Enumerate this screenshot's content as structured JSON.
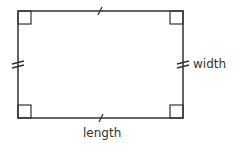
{
  "diagram": {
    "shape": "rectangle",
    "labels": {
      "width": "width",
      "length": "length"
    },
    "marks": {
      "right_angles": 4,
      "length_ticks": "single",
      "width_ticks": "double"
    },
    "colors": {
      "stroke": "#333333",
      "background": "#ffffff"
    }
  }
}
